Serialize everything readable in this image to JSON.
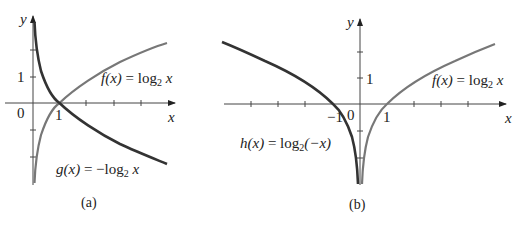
{
  "panels": [
    {
      "id": "a",
      "caption": "(a)",
      "axis_labels": {
        "x": "x",
        "y": "y"
      },
      "tick_labels": {
        "origin": "0",
        "x_one": "1",
        "y_one": "1"
      },
      "curves": [
        {
          "name": "f",
          "label_fn": "f(x)",
          "label_eq": " = log",
          "label_sub": "2",
          "label_arg": " x",
          "color": "#777777",
          "expr": "log2(x)"
        },
        {
          "name": "g",
          "label_fn": "g(x)",
          "label_eq": " = −log",
          "label_sub": "2",
          "label_arg": " x",
          "color": "#333333",
          "expr": "-log2(x)"
        }
      ]
    },
    {
      "id": "b",
      "caption": "(b)",
      "axis_labels": {
        "x": "x",
        "y": "y"
      },
      "tick_labels": {
        "origin": "0",
        "x_one": "1",
        "x_neg_one": "−1",
        "y_one": "1"
      },
      "curves": [
        {
          "name": "f",
          "label_fn": "f(x)",
          "label_eq": " = log",
          "label_sub": "2",
          "label_arg": " x",
          "color": "#777777",
          "expr": "log2(x)"
        },
        {
          "name": "h",
          "label_fn": "h(x)",
          "label_eq": " = log",
          "label_sub": "2",
          "label_arg": "(−x)",
          "color": "#333333",
          "expr": "log2(-x)"
        }
      ]
    }
  ]
}
